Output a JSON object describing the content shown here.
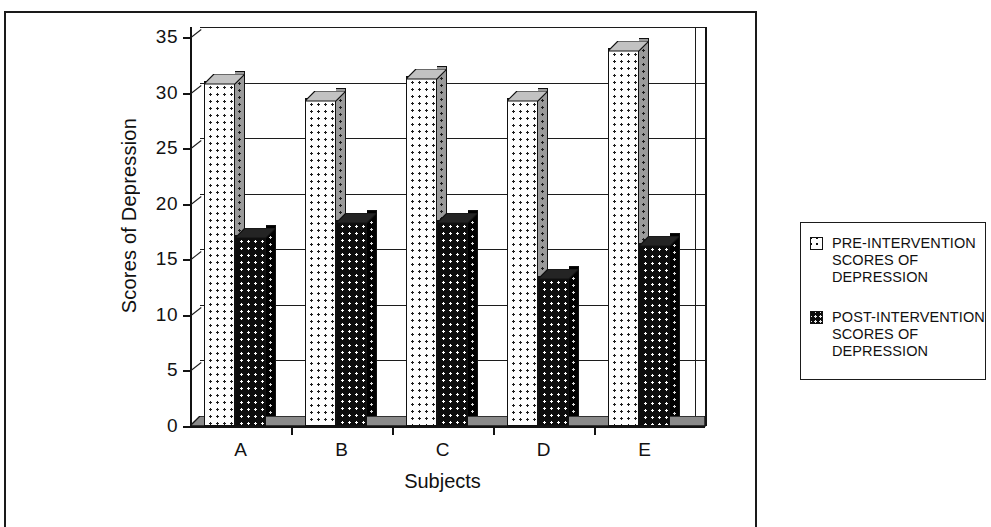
{
  "chart_data": {
    "type": "bar",
    "title": "",
    "xlabel": "Subjects",
    "ylabel": "Scores of Depression",
    "categories": [
      "A",
      "B",
      "C",
      "D",
      "E"
    ],
    "yticks": [
      0,
      5,
      10,
      15,
      20,
      25,
      30,
      35
    ],
    "ylim": [
      0,
      35
    ],
    "grid": true,
    "legend_position": "right",
    "style": "3d-clustered-column",
    "series": [
      {
        "name": "PRE-INTERVENTION SCORES OF DEPRESSION",
        "short_name": "PRE-INTERVENTION",
        "values": [
          31,
          29.5,
          31.5,
          29.5,
          34
        ],
        "swatch": "pre"
      },
      {
        "name": "POST-INTERVENTION SCORES OF DEPRESSION",
        "short_name": "POST-INTERVENTION",
        "values": [
          17.2,
          18.5,
          18.5,
          13.5,
          16.5
        ],
        "swatch": "post"
      }
    ]
  },
  "legend": {
    "entries": [
      {
        "label": "PRE-INTERVENTION\nSCORES OF\nDEPRESSION",
        "swatch": "pre"
      },
      {
        "label": "POST-INTERVENTION\nSCORES OF\nDEPRESSION",
        "swatch": "post"
      }
    ]
  },
  "colors": {
    "pre_fill": "#fdfdfd",
    "post_fill": "#0d0d0d",
    "line": "#131313",
    "background": "#ffffff"
  }
}
